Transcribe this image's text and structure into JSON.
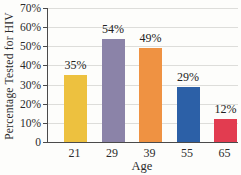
{
  "chart_data": {
    "type": "bar",
    "title": "",
    "ylabel": "Percentage Tested for HIV",
    "xlabel": "Age",
    "categories": [
      "21",
      "29",
      "39",
      "55",
      "65"
    ],
    "values": [
      35,
      54,
      49,
      29,
      12
    ],
    "bar_labels": [
      "35%",
      "54%",
      "49%",
      "29%",
      "12%"
    ],
    "bar_colors": [
      "#EDC13F",
      "#8B83A8",
      "#EF9242",
      "#2C60A7",
      "#E23C50"
    ],
    "ylim": [
      0,
      70
    ],
    "ytick_step": 10,
    "ytick_labels": [
      "70%",
      "60%",
      "50%",
      "40%",
      "30%",
      "20%",
      "10%",
      "0"
    ],
    "grid": "horizontal",
    "legend": "none",
    "axis_color": "#4a4a4a",
    "grid_color": "#ddddda",
    "text_color": "#2b2b2b",
    "background_color": "#fdfdfb"
  }
}
